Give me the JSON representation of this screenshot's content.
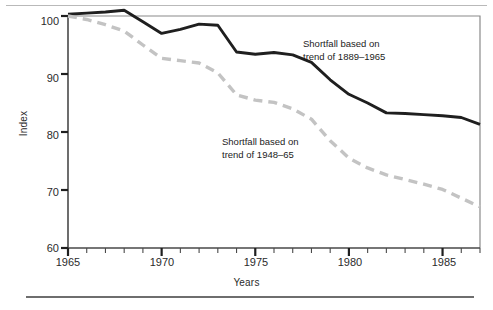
{
  "figure": {
    "y_axis_title": "Index",
    "x_axis_title": "Years",
    "annotations": [
      {
        "name": "annotation-1889-1965",
        "line1": "Shortfall based on",
        "line2": "trend of 1889–1965"
      },
      {
        "name": "annotation-1948-65",
        "line1": "Shortfall based on",
        "line2": "trend of 1948–65"
      }
    ],
    "y_tick_labels": [
      "100",
      "90",
      "80",
      "70",
      "60"
    ],
    "x_tick_labels": [
      "1965",
      "1970",
      "1975",
      "1980",
      "1985"
    ],
    "colors": {
      "solid_series": "#1f1f1f",
      "dashed_series": "#c3c3c3",
      "axis": "#4a4a4a",
      "frame": "#8a8a8a",
      "rule": "#6e6e6e"
    }
  },
  "chart_data": {
    "type": "line",
    "title": "",
    "subtitle": "",
    "xlabel": "Years",
    "ylabel": "Index",
    "xlim": [
      1965,
      1987
    ],
    "ylim": [
      60,
      100
    ],
    "yticks": [
      60,
      70,
      80,
      90,
      100
    ],
    "xticks": [
      1965,
      1970,
      1975,
      1980,
      1985
    ],
    "minor_xticks_every": 1,
    "grid": false,
    "legend": "annotations-inline",
    "x": [
      1965,
      1966,
      1967,
      1968,
      1969,
      1970,
      1971,
      1972,
      1973,
      1974,
      1975,
      1976,
      1977,
      1978,
      1979,
      1980,
      1981,
      1982,
      1983,
      1984,
      1985,
      1986,
      1987
    ],
    "series": [
      {
        "name": "Shortfall based on trend of 1889-1965",
        "style": "solid",
        "color": "#1f1f1f",
        "values": [
          100.3,
          100.5,
          100.7,
          101.0,
          99.0,
          97.0,
          97.7,
          98.6,
          98.4,
          93.8,
          93.4,
          93.7,
          93.3,
          92.0,
          89.0,
          86.5,
          85.0,
          83.3,
          83.2,
          83.0,
          82.8,
          82.5,
          81.3
        ]
      },
      {
        "name": "Shortfall based on trend of 1948-65",
        "style": "dashed",
        "color": "#c3c3c3",
        "values": [
          100.0,
          99.4,
          98.5,
          97.4,
          95.0,
          92.7,
          92.3,
          91.9,
          90.2,
          86.4,
          85.5,
          85.1,
          84.0,
          82.2,
          78.5,
          75.5,
          73.8,
          72.6,
          71.8,
          71.0,
          70.1,
          68.6,
          67.1
        ]
      }
    ]
  }
}
